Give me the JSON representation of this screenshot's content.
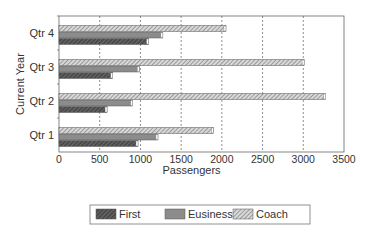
{
  "chart_data": {
    "type": "bar",
    "orientation": "horizontal",
    "title": "",
    "xlabel": "Passengers",
    "ylabel": "Current Year",
    "xlim": [
      0,
      3500
    ],
    "xticks": [
      0,
      500,
      1000,
      1500,
      2000,
      2500,
      3000,
      3500
    ],
    "grid": "vertical dashed",
    "legend_position": "bottom",
    "categories": [
      "Qtr 1",
      "Qtr 2",
      "Qtr 3",
      "Qtr 4"
    ],
    "series": [
      {
        "name": "First",
        "values": [
          970,
          590,
          660,
          1100
        ],
        "fill": "#555555",
        "pattern": "dense-hatch"
      },
      {
        "name": "Eusiness",
        "values": [
          1215,
          905,
          985,
          1275
        ],
        "fill": "#8a8a8a",
        "pattern": "solid"
      },
      {
        "name": "Coach",
        "values": [
          1895,
          3275,
          3010,
          2050
        ],
        "fill": "#bdbdbd",
        "pattern": "diagonal-hatch"
      }
    ]
  },
  "legend": {
    "items": [
      "First",
      "Eusiness",
      "Coach"
    ]
  }
}
